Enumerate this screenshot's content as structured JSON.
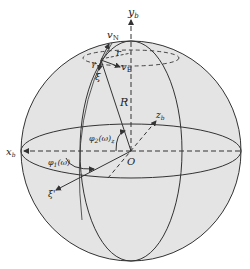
{
  "diagram": {
    "colors": {
      "sphere_fill": "#e4e4e4",
      "stroke": "#333333",
      "background": "#ffffff"
    },
    "labels": {
      "y_axis": "y",
      "y_axis_sub": "b",
      "x_axis": "x",
      "x_axis_sub": "b",
      "z_axis": "z",
      "z_axis_sub": "b",
      "v_north": "v",
      "v_north_sub": "N",
      "v_east": "v",
      "v_east_sub": "E",
      "radius_small": "r",
      "radius": "R",
      "xi": "ξ",
      "xi_prime": "ξ'",
      "gamma": "γ",
      "origin": "O",
      "phi1": "φ",
      "phi1_sub": "1",
      "phi1_arg": "(ω)",
      "phi2": "φ",
      "phi2_sub": "2",
      "phi2_arg": "(ω)",
      "phi2_tail": "z"
    }
  }
}
